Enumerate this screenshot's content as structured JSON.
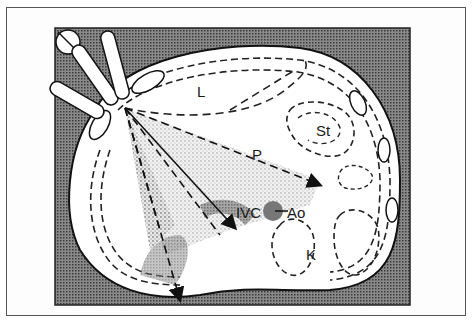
{
  "figure": {
    "colors": {
      "background": "#7a7a7a",
      "body": "#ffffff",
      "lines": "#1a1a1a",
      "frame": "#555555"
    },
    "labels": {
      "liver": "L",
      "pancreas": "P",
      "stomach": "St",
      "ivc": "IVC",
      "aorta": "Ao",
      "kidney": "K"
    }
  }
}
